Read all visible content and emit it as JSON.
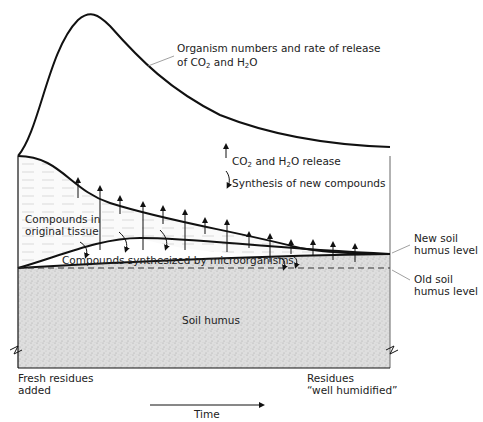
{
  "diagram": {
    "curve_label_line1": "Organism numbers and rate of release",
    "curve_label_line2_pre": "of CO",
    "curve_label_line2_sub1": "2",
    "curve_label_line2_mid": " and H",
    "curve_label_line2_sub2": "2",
    "curve_label_line2_post": "O",
    "legend_release_pre": "CO",
    "legend_release_sub1": "2",
    "legend_release_mid": " and H",
    "legend_release_sub2": "2",
    "legend_release_post": "O release",
    "legend_synthesis": "Synthesis of new compounds",
    "original_tissue_line1": "Compounds in",
    "original_tissue_line2": "original tissue",
    "synthesized": "Compounds synthesized by microorganisms",
    "new_level_line1": "New soil",
    "new_level_line2": "humus level",
    "old_level_line1": "Old soil",
    "old_level_line2": "humus level",
    "soil_humus": "Soil humus",
    "left_bottom_line1": "Fresh residues",
    "left_bottom_line2": "added",
    "right_bottom_line1": "Residues",
    "right_bottom_line2": "“well humidified”",
    "time_label": "Time"
  },
  "colors": {
    "line": "#111111",
    "humus_fill": "#dcdcdc",
    "tissue_fill": "#f2f2f2"
  }
}
